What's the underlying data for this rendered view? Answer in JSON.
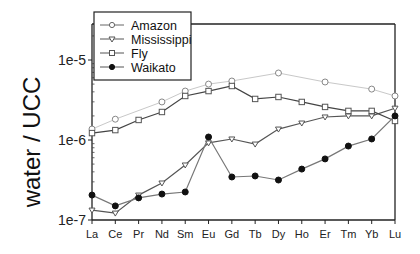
{
  "chart_data": {
    "type": "line",
    "title": "",
    "xlabel": "",
    "ylabel": "water / UCC",
    "yscale": "log",
    "ylim": [
      1e-07,
      3e-05
    ],
    "y_ticks": [
      {
        "value": 1e-07,
        "label": "1e-7"
      },
      {
        "value": 1e-06,
        "label": "1e-6"
      },
      {
        "value": 1e-05,
        "label": "1e-5"
      }
    ],
    "categories": [
      "La",
      "Ce",
      "Pr",
      "Nd",
      "Sm",
      "Eu",
      "Gd",
      "Tb",
      "Dy",
      "Ho",
      "Er",
      "Tm",
      "Yb",
      "Lu"
    ],
    "legend_position": "upper-left",
    "grid": false,
    "series": [
      {
        "name": "Amazon",
        "marker": "open-circle",
        "line_color": "#c8c8c8",
        "values": [
          1.37e-06,
          1.82e-06,
          null,
          2.99e-06,
          4.09e-06,
          5e-06,
          5.46e-06,
          null,
          6.88e-06,
          null,
          5.31e-06,
          null,
          4.33e-06,
          3.55e-06
        ]
      },
      {
        "name": "Mississippi",
        "marker": "open-triangle-down",
        "line_color": "#555555",
        "values": [
          1.33e-07,
          1.22e-07,
          2.05e-07,
          2.9e-07,
          4.87e-07,
          9.2e-07,
          1.03e-06,
          8.9e-07,
          1.37e-06,
          1.63e-06,
          1.94e-06,
          2e-06,
          2e-06,
          2.5e-06
        ]
      },
      {
        "name": "Fly",
        "marker": "open-square",
        "line_color": "#444444",
        "values": [
          1.22e-06,
          1.33e-06,
          1.78e-06,
          2.24e-06,
          3.55e-06,
          4.09e-06,
          4.73e-06,
          3.26e-06,
          3.45e-06,
          2.99e-06,
          2.59e-06,
          2.31e-06,
          2.31e-06,
          1.73e-06
        ]
      },
      {
        "name": "Waikato",
        "marker": "filled-circle",
        "line_color": "#777777",
        "values": [
          2.05e-07,
          1.5e-07,
          1.89e-07,
          2.11e-07,
          2.24e-07,
          1.09e-06,
          3.45e-07,
          3.55e-07,
          3.16e-07,
          4.33e-07,
          5.8e-07,
          8.4e-07,
          1.03e-06,
          2e-06
        ]
      }
    ]
  },
  "legend": {
    "items": [
      {
        "label": "Amazon"
      },
      {
        "label": "Mississippi"
      },
      {
        "label": "Fly"
      },
      {
        "label": "Waikato"
      }
    ]
  },
  "axes": {
    "ylabel": "water / UCC"
  }
}
